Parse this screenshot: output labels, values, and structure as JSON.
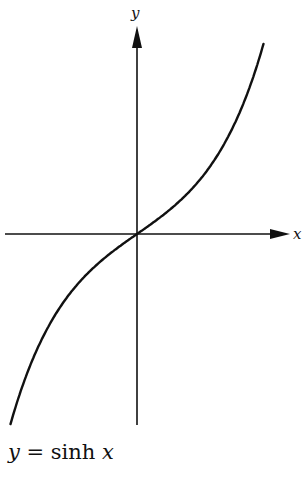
{
  "chart_data": {
    "type": "line",
    "title": "y = sinh x",
    "xlabel": "x",
    "ylabel": "y",
    "grid": false,
    "legend": null,
    "function": "sinh(x)",
    "xlim": [
      -2.3,
      2.3
    ],
    "ylim": [
      -5.0,
      5.0
    ],
    "series": [
      {
        "name": "sinh x",
        "x": [
          -2.3,
          -2.0,
          -1.5,
          -1.0,
          -0.5,
          0,
          0.5,
          1.0,
          1.5,
          2.0,
          2.3
        ],
        "values": [
          -4.94,
          -3.63,
          -2.13,
          -1.18,
          -0.52,
          0,
          0.52,
          1.18,
          2.13,
          3.63,
          4.94
        ]
      }
    ],
    "ticks": "none"
  },
  "labels": {
    "x_axis": "x",
    "y_axis": "y",
    "caption_lhs": "y",
    "caption_eq": " = sinh ",
    "caption_rhs": "x"
  }
}
